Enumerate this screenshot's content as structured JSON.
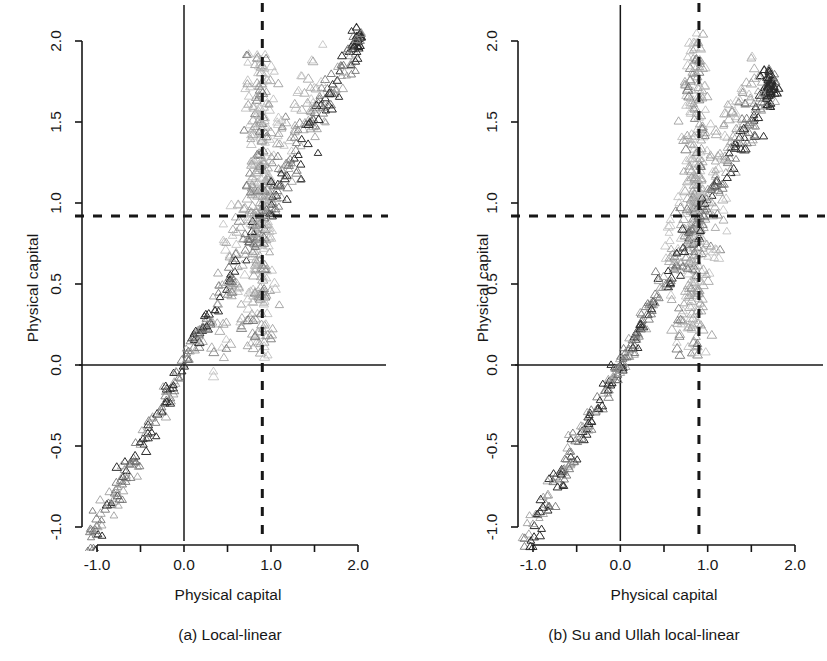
{
  "figure": {
    "background": "#ffffff",
    "ink": "#171717",
    "width": 827,
    "height": 661
  },
  "panels": [
    {
      "id": "panel-a",
      "caption": "(a) Local-linear",
      "xlabel": "Physical capital",
      "ylabel": "Physical capital",
      "xticks": [
        "-1.0",
        "0.0",
        "1.0",
        "2.0"
      ],
      "xtick_values": [
        -1.0,
        0.0,
        1.0,
        2.0
      ],
      "xminor_values": [
        -0.5,
        0.5,
        1.5
      ],
      "yticks": [
        "2.0",
        "1.5",
        "1.0",
        "0.5",
        "0.0",
        "-0.5",
        "-1.0"
      ],
      "ytick_values": [
        2.0,
        1.5,
        1.0,
        0.5,
        0.0,
        -0.5,
        -1.0
      ],
      "reference_lines": {
        "vertical_dashed_x": 0.9,
        "horizontal_dashed_y": 0.92,
        "vertical_solid_x": 0.0,
        "horizontal_solid_y": 0.0
      }
    },
    {
      "id": "panel-b",
      "caption": "(b) Su and Ullah local-linear",
      "xlabel": "Physical capital",
      "ylabel": "Physical capital",
      "xticks": [
        "-1.0",
        "0.0",
        "1.0",
        "2.0"
      ],
      "xtick_values": [
        -1.0,
        0.0,
        1.0,
        2.0
      ],
      "xminor_values": [
        -0.5,
        0.5,
        1.5
      ],
      "yticks": [
        "2.0",
        "1.5",
        "1.0",
        "0.5",
        "0.0",
        "-0.5",
        "-1.0"
      ],
      "ytick_values": [
        2.0,
        1.5,
        1.0,
        0.5,
        0.0,
        -0.5,
        -1.0
      ],
      "reference_lines": {
        "vertical_dashed_x": 0.9,
        "horizontal_dashed_y": 0.92,
        "vertical_solid_x": 0.0,
        "horizontal_solid_y": 0.0
      }
    }
  ],
  "chart_data": {
    "type": "scatter",
    "title": "",
    "marker": "open-triangle",
    "marker_colors": [
      "#2b2b2b",
      "#6e6e6e",
      "#9a9a9a",
      "#bcbcbc"
    ],
    "xlabel": "Physical capital",
    "ylabel": "Physical capital",
    "xlim": [
      -1.22,
      2.22
    ],
    "ylim": [
      -1.22,
      2.22
    ],
    "grid": false,
    "legend": false,
    "series": [
      {
        "name": "(a) Local-linear",
        "panel": "panel-a",
        "n_points": 820,
        "description": "Dense diagonal band along y=x from (-1.1,-1.1) to (2.05,2.05), with a broad vertical plume of scatter concentrated near x=0.85-0.95 spanning y=0.0 to 1.9, and a tight dark cluster at (2.0,2.0).",
        "clusters": [
          {
            "kind": "diagonal-band",
            "x_range": [
              -1.12,
              2.05
            ],
            "y_equals_x": true,
            "spread": 0.055,
            "weight": 0.46
          },
          {
            "kind": "vertical-plume",
            "x_center": 0.885,
            "x_spread": 0.075,
            "y_range": [
              0.02,
              1.92
            ],
            "weight": 0.34
          },
          {
            "kind": "upper-fan",
            "x_range": [
              0.45,
              1.6
            ],
            "y_offset_range": [
              0.05,
              0.45
            ],
            "weight": 0.12
          },
          {
            "kind": "lower-fan",
            "x_range": [
              0.3,
              1.0
            ],
            "y_offset_range": [
              -0.45,
              -0.05
            ],
            "weight": 0.05
          },
          {
            "kind": "dark-knot",
            "x_center": 1.995,
            "y_center": 2.0,
            "spread": 0.035,
            "weight": 0.03
          }
        ]
      },
      {
        "name": "(b) Su and Ullah local-linear",
        "panel": "panel-b",
        "n_points": 820,
        "description": "Same y=x diagonal band but the vertical plume is narrower and shifted slightly left of x=0.9, the main diagonal ridge extends only to about (1.75,1.75) where a dark knot sits, and lower-right scatter near y=0.1-0.5 is heavier.",
        "clusters": [
          {
            "kind": "diagonal-band",
            "x_range": [
              -1.12,
              1.78
            ],
            "y_equals_x": true,
            "spread": 0.05,
            "weight": 0.47
          },
          {
            "kind": "vertical-plume",
            "x_center": 0.855,
            "x_spread": 0.07,
            "y_range": [
              0.05,
              2.05
            ],
            "weight": 0.32
          },
          {
            "kind": "upper-fan",
            "x_range": [
              0.5,
              1.55
            ],
            "y_offset_range": [
              0.05,
              0.4
            ],
            "weight": 0.11
          },
          {
            "kind": "lower-fan",
            "x_range": [
              0.55,
              1.25
            ],
            "y_offset_range": [
              -0.55,
              -0.08
            ],
            "weight": 0.07
          },
          {
            "kind": "dark-knot",
            "x_center": 1.7,
            "y_center": 1.73,
            "spread": 0.04,
            "weight": 0.03
          }
        ]
      }
    ]
  }
}
